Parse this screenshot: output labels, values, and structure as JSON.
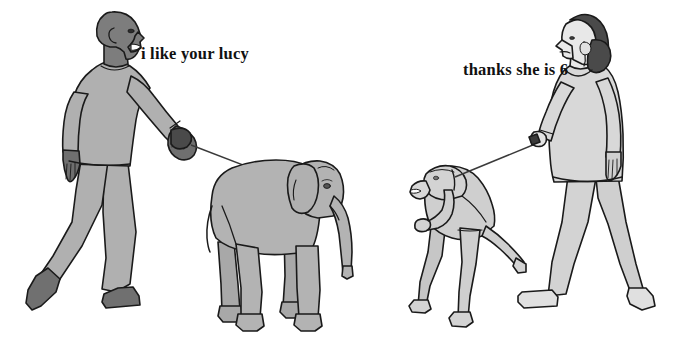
{
  "meme": {
    "title": "i like your lucy / thanks she is 6",
    "background_color": "#ffffff",
    "panels": [
      {
        "id": "left",
        "speaker": "bald-man-walking-elephant",
        "caption": "i like your lucy",
        "caption_x": 141,
        "caption_y": 44
      },
      {
        "id": "right",
        "speaker": "woman-walking-crouched-person",
        "caption": "thanks she is 6",
        "caption_x": 463,
        "caption_y": 60
      }
    ]
  },
  "figures": {
    "man": {
      "label": "bald man",
      "skin_color": "#7d7d7d",
      "clothing_color": "#b0b0b0",
      "shoe_color": "#707070",
      "outline_color": "#1a1a1a",
      "direction": "walking-right"
    },
    "elephant": {
      "label": "elephant named Lucy",
      "body_color": "#b3b3b3",
      "outline_color": "#1a1a1a",
      "direction": "facing-right"
    },
    "crouched_person": {
      "label": "crouched person on leash",
      "body_color": "#d3d3d3",
      "outline_color": "#1a1a1a",
      "direction": "facing-left"
    },
    "woman": {
      "label": "woman with dark hair bun",
      "hair_color": "#4a4a4a",
      "skin_color": "#e8e8e8",
      "clothing_color": "#d8d8d8",
      "outline_color": "#1a1a1a",
      "direction": "walking-left"
    },
    "leash": {
      "label": "leash",
      "color": "#3a3a3a"
    }
  },
  "colors": {
    "ink": "#1a1a1a",
    "paper": "#ffffff",
    "mid_gray": "#b0b0b0",
    "dark_gray": "#707070",
    "light_gray": "#d8d8d8"
  }
}
